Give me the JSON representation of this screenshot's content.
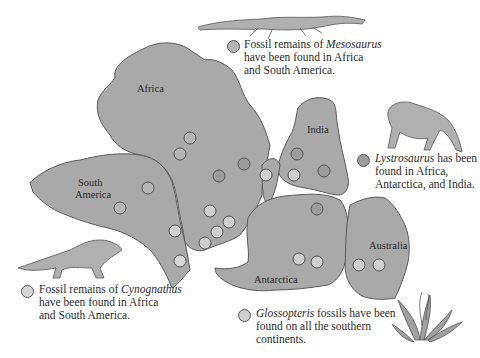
{
  "continents": [
    {
      "name": "Africa",
      "label": "Africa"
    },
    {
      "name": "South America",
      "label_line1": "South",
      "label_line2": "America"
    },
    {
      "name": "India",
      "label": "India"
    },
    {
      "name": "Antarctica",
      "label": "Antarctica"
    },
    {
      "name": "Australia",
      "label": "Australia"
    }
  ],
  "colors": {
    "land": "#a9a9a9",
    "coast": "#5a5a5a",
    "mesosaurus_dot": "#b5b5b5",
    "cynognathus_dot": "#d6d6d6",
    "lystrosaurus_dot": "#9c9c9c",
    "glossopteris_dot": "#cfcfcf"
  },
  "legend": {
    "mesosaurus": {
      "prefix": "Fossil remains of ",
      "genus": "Mesosaurus",
      "line2": "have been found in Africa",
      "line3": "and South America."
    },
    "lystrosaurus": {
      "genus": "Lystrosaurus",
      "suffix": " has been",
      "line2": "found in Africa,",
      "line3": "Antarctica, and India."
    },
    "cynognathus": {
      "prefix": "Fossil remains of ",
      "genus": "Cynognathus",
      "line2": "have been found in Africa",
      "line3": "and South America."
    },
    "glossopteris": {
      "genus": "Glossopteris",
      "suffix": " fossils have been",
      "line2": "found on all the southern",
      "line3": "continents."
    }
  },
  "illustrations": [
    "mesosaurus",
    "lystrosaurus",
    "cynognathus",
    "glossopteris-plant"
  ]
}
